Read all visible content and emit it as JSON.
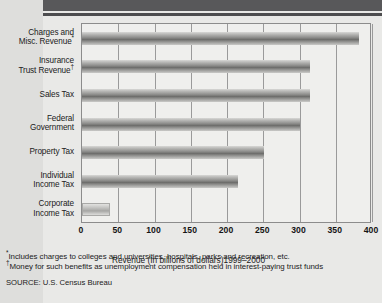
{
  "chart_data": {
    "type": "bar",
    "orientation": "horizontal",
    "title": "",
    "xlabel": "Revenue (In billions of dollars)1999–2000",
    "ylabel": "",
    "xlim": [
      0,
      400
    ],
    "xticks": [
      0,
      50,
      100,
      150,
      200,
      250,
      300,
      350,
      400
    ],
    "xtick_labels": [
      "0",
      "50",
      "100",
      "150",
      "200",
      "250",
      "300",
      "350",
      "400"
    ],
    "grid": true,
    "legend": "none",
    "categories": [
      "Charges and Misc. Revenue*",
      "Insurance Trust Revenue†",
      "Sales Tax",
      "Federal Government",
      "Property Tax",
      "Individual Income Tax",
      "Corporate Income Tax"
    ],
    "values": [
      382,
      315,
      315,
      300,
      251,
      215,
      39
    ],
    "bar_styles": [
      "dark",
      "dark",
      "dark",
      "dark",
      "dark",
      "dark",
      "light"
    ]
  },
  "categories": [
    {
      "line1": "Charges and",
      "line2": "Misc. Revenue",
      "marker": "*",
      "value": 382,
      "style": "dark"
    },
    {
      "line1": "Insurance",
      "line2": "Trust Revenue",
      "marker": "†",
      "value": 315,
      "style": "dark"
    },
    {
      "line1": "Sales Tax",
      "line2": "",
      "marker": "",
      "value": 315,
      "style": "dark"
    },
    {
      "line1": "Federal",
      "line2": "Government",
      "marker": "",
      "value": 300,
      "style": "dark"
    },
    {
      "line1": "Property Tax",
      "line2": "",
      "marker": "",
      "value": 251,
      "style": "dark"
    },
    {
      "line1": "Individual",
      "line2": "Income Tax",
      "marker": "",
      "value": 215,
      "style": "dark"
    },
    {
      "line1": "Corporate",
      "line2": "Income Tax",
      "marker": "",
      "value": 39,
      "style": "light"
    }
  ],
  "axis": {
    "title": "Revenue (In billions of dollars)1999–2000",
    "ticks": [
      "0",
      "50",
      "100",
      "150",
      "200",
      "250",
      "300",
      "350",
      "400"
    ]
  },
  "footnotes": {
    "note1_marker": "*",
    "note1": "Includes charges to colleges and universities, hospitals, parks and recreation, etc.",
    "note2_marker": "†",
    "note2": "Money for such benefits as unemployment compensation held in interest-paying trust funds",
    "source": "SOURCE: U.S. Census Bureau"
  },
  "colors": {
    "page_background": "#e9e9e7",
    "plot_background": "#efefed",
    "header_band": "#58585a",
    "gridline": "#9a9a9a",
    "bar_dark": "#6e6e6c",
    "bar_light": "#c4c4c2",
    "text": "#1b1b1b"
  }
}
